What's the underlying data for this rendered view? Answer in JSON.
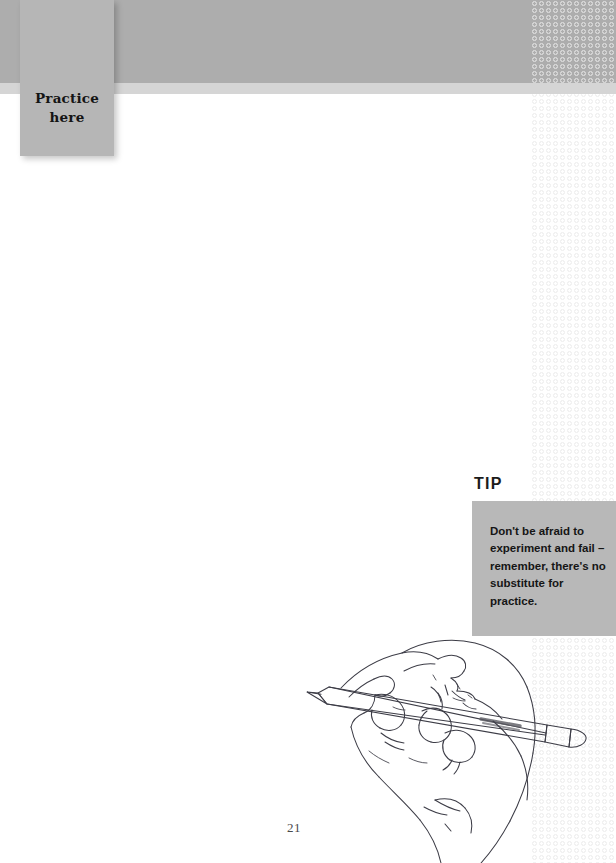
{
  "page": {
    "number": "21",
    "background_color": "#ffffff"
  },
  "banner": {
    "band_color": "#adadad",
    "light_strip_color": "#d5d5d5",
    "pattern_icon": "circle-grid-pattern"
  },
  "practice_tab": {
    "label": "Practice\nhere",
    "background_color": "#b6b6b6"
  },
  "tip": {
    "heading": "TIP",
    "body": "Don't be afraid to experiment and fail – remember, there's no substitute for practice.",
    "box_color": "#b8b8b8"
  },
  "illustration": {
    "name": "hand-holding-pencil-drawing",
    "description": "Line drawing of a hand holding a pencil",
    "stroke_color": "#3c3c46"
  }
}
